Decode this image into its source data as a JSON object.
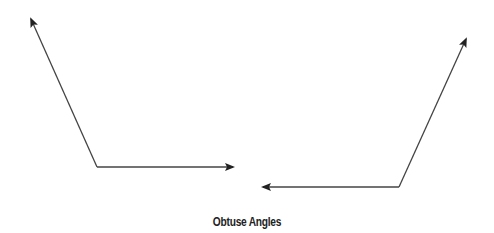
{
  "caption": "Obtuse Angles",
  "colors": {
    "stroke": "#333333",
    "background": "#ffffff"
  },
  "angles": [
    {
      "name": "left-angle",
      "vertex": [
        97,
        167
      ],
      "ray1_end": [
        30,
        17
      ],
      "ray2_end": [
        234,
        167
      ]
    },
    {
      "name": "right-angle",
      "vertex": [
        399,
        187
      ],
      "ray1_end": [
        467,
        37
      ],
      "ray2_end": [
        262,
        187
      ]
    }
  ]
}
